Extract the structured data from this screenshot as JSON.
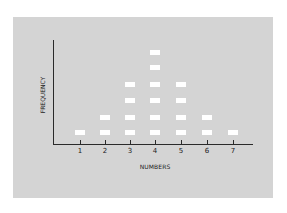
{
  "chart_data": {
    "type": "scatter",
    "subtype": "dot-plot",
    "title": "",
    "xlabel": "NUMBERS",
    "ylabel": "FREQUENCY",
    "categories": [
      "1",
      "2",
      "3",
      "4",
      "5",
      "6",
      "7"
    ],
    "values": [
      1,
      2,
      4,
      6,
      4,
      2,
      1
    ],
    "ylim": [
      0,
      6
    ],
    "grid": false,
    "legend": null,
    "colors": {
      "panel": "#d4d4d4",
      "marker": "#ffffff",
      "axis": "#2a2a2a"
    }
  },
  "axes": {
    "xlabel": "NUMBERS",
    "ylabel": "FREQUENCY",
    "ticks": [
      "1",
      "2",
      "3",
      "4",
      "5",
      "6",
      "7"
    ]
  }
}
